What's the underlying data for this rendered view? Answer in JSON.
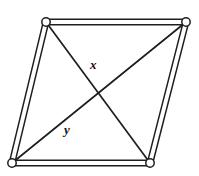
{
  "figure": {
    "kind": "geometry-diagram",
    "shape_name": "parallelogram",
    "background_color": "#ffffff",
    "ink_color": "#1e1e1e",
    "joint_fill_color": "#ffffff",
    "canvas": {
      "width": 199,
      "height": 176
    }
  },
  "vertices": [
    {
      "name": "top-left",
      "id": "A",
      "x": 46,
      "y": 22,
      "joint_radius": 4.2
    },
    {
      "name": "top-right",
      "id": "B",
      "x": 186,
      "y": 22,
      "joint_radius": 4.2
    },
    {
      "name": "bottom-right",
      "id": "C",
      "x": 150,
      "y": 163,
      "joint_radius": 4.2
    },
    {
      "name": "bottom-left",
      "id": "D",
      "x": 12,
      "y": 163,
      "joint_radius": 4.2
    }
  ],
  "edges": [
    {
      "name": "top-edge",
      "from": "A",
      "to": "B",
      "style": "double-bar"
    },
    {
      "name": "right-edge",
      "from": "B",
      "to": "C",
      "style": "double-bar"
    },
    {
      "name": "bottom-edge",
      "from": "C",
      "to": "D",
      "style": "double-bar"
    },
    {
      "name": "left-edge",
      "from": "D",
      "to": "A",
      "style": "double-bar"
    }
  ],
  "diagonals": [
    {
      "name": "diagonal-x",
      "label": "x",
      "from": "A",
      "to": "C",
      "label_position": {
        "x": 90,
        "y": 58
      }
    },
    {
      "name": "diagonal-y",
      "label": "y",
      "from": "D",
      "to": "B",
      "label_position": {
        "x": 64,
        "y": 123
      }
    }
  ],
  "intersection": {
    "name": "diagonal-crossing-point",
    "x": 99,
    "y": 92
  },
  "labels": {
    "x": "x",
    "y": "y"
  }
}
